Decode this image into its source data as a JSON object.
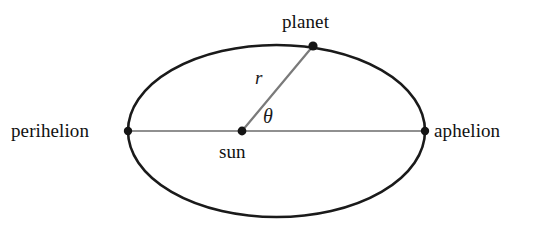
{
  "diagram": {
    "background_color": "#ffffff",
    "labels": {
      "perihelion": "perihelion",
      "aphelion": "aphelion",
      "planet": "planet",
      "sun": "sun",
      "radius_symbol": "r",
      "angle_symbol": "θ"
    },
    "colors": {
      "orbit_stroke": "#1a1a1a",
      "axis_stroke": "#6b6b6b",
      "radius_stroke": "#7a7a7a",
      "marker_fill": "#141414",
      "text": "#111111"
    },
    "geometry": {
      "ellipse": {
        "cx": 276.5,
        "cy": 131,
        "rx": 148.5,
        "ry": 86,
        "stroke_width": 2.6
      },
      "major_axis": {
        "x1": 128,
        "y1": 131,
        "x2": 425,
        "y2": 131,
        "stroke_width": 1.4
      },
      "radius_line": {
        "x1": 242,
        "y1": 131,
        "x2": 313,
        "y2": 46,
        "stroke_width": 2.2
      },
      "points": {
        "perihelion": {
          "x": 128,
          "y": 131,
          "r": 4.2
        },
        "aphelion": {
          "x": 425,
          "y": 131,
          "r": 4.2
        },
        "sun": {
          "x": 242,
          "y": 131,
          "r": 4.4
        },
        "planet": {
          "x": 313,
          "y": 46,
          "r": 4.6
        }
      }
    }
  }
}
